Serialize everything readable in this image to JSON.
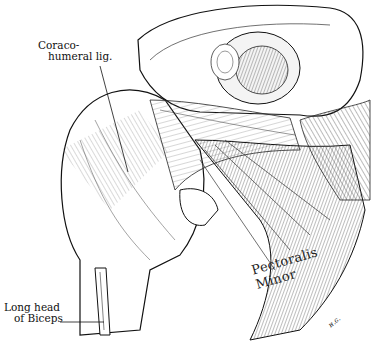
{
  "figure": {
    "type": "anatomical-illustration",
    "style": "pen-and-ink line engraving"
  },
  "labels": {
    "coracohumeral": {
      "line1": "Coraco-",
      "line2": "humeral lig."
    },
    "biceps": {
      "line1": "Long head",
      "line2": "of Biceps"
    },
    "pectoralis": "Pectoralis Minor",
    "signature": "H.G.",
    "signature_display": "ʜ.ɢ."
  },
  "colors": {
    "ink": "#111111",
    "paper": "#ffffff",
    "shade": "#9a9a9a"
  }
}
